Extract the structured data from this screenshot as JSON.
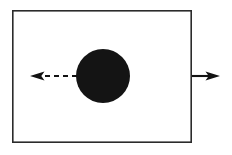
{
  "figure": {
    "title": "",
    "caption": "",
    "width": 232,
    "height": 155,
    "background_color": "#ffffff"
  },
  "shapes": {
    "boundary": {
      "name": "rectangle-frame",
      "x": 12,
      "y": 10,
      "width": 180,
      "height": 133,
      "stroke_color": "#2b2b2b",
      "stroke_width": 1.6,
      "fill": "none"
    },
    "circle": {
      "name": "filled-black-circle",
      "cx": 103,
      "cy": 76,
      "r": 27,
      "fill_color": "#141414"
    }
  },
  "arrows": [
    {
      "name": "left-arrow",
      "direction": "left",
      "style": "dashed",
      "line_start_x": 77,
      "line_end_x": 41,
      "tip_x": 30,
      "y": 76,
      "dash_pattern": "5 4",
      "color": "#121212",
      "label": ""
    },
    {
      "name": "right-arrow",
      "direction": "right",
      "style": "solid",
      "line_start_x": 192,
      "line_end_x": 209,
      "tip_x": 220,
      "y": 76,
      "dash_pattern": "",
      "color": "#121212",
      "label": ""
    }
  ]
}
